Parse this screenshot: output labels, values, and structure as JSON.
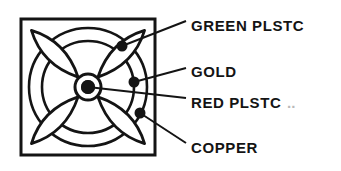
{
  "figure": {
    "name": "fan-impeller-exploded-callout-diagram",
    "type": "line-drawing",
    "line_color": "#141414",
    "fill_color": "#ffffff",
    "frame": {
      "name": "square-housing",
      "x": 21,
      "y": 19,
      "width": 134,
      "height": 136,
      "stroke_width": 3
    },
    "circles": [
      {
        "name": "outer-ring",
        "cx": 88,
        "cy": 87,
        "r": 59,
        "stroke_width": 2.6
      },
      {
        "name": "inner-ring",
        "cx": 88,
        "cy": 87,
        "r": 46,
        "stroke_width": 2.6
      }
    ],
    "hub": {
      "name": "center-hub",
      "cx": 88,
      "cy": 87,
      "outer_r": 13,
      "ring_r": 9,
      "dot_r": 7
    },
    "blades": {
      "name": "petal-blades",
      "count": 4,
      "angles_deg": [
        45,
        135,
        225,
        315
      ],
      "length": 66,
      "half_width": 17
    }
  },
  "callouts": [
    {
      "id": "green-plstc",
      "label": "GREEN PLSTC",
      "dot": {
        "cx": 122,
        "cy": 46,
        "r": 5.5
      },
      "leader": {
        "x1": 122,
        "y1": 46,
        "x2": 186,
        "y2": 21
      },
      "text": {
        "x": 191,
        "y": 31
      }
    },
    {
      "id": "gold",
      "label": "GOLD",
      "dot": {
        "cx": 134,
        "cy": 82,
        "r": 5.5
      },
      "leader": {
        "x1": 134,
        "y1": 82,
        "x2": 186,
        "y2": 68
      },
      "text": {
        "x": 191,
        "y": 77
      }
    },
    {
      "id": "red-plstc",
      "label": "RED  PLSTC",
      "dot": {
        "cx": 88,
        "cy": 87,
        "r": 7
      },
      "leader": {
        "x1": 88,
        "y1": 87,
        "x2": 186,
        "y2": 98
      },
      "text": {
        "x": 191,
        "y": 108
      },
      "trailing_artifact": ".."
    },
    {
      "id": "copper",
      "label": "COPPER",
      "dot": {
        "cx": 140,
        "cy": 113,
        "r": 5.5
      },
      "leader": {
        "x1": 140,
        "y1": 113,
        "x2": 186,
        "y2": 143
      },
      "text": {
        "x": 191,
        "y": 153
      }
    }
  ]
}
